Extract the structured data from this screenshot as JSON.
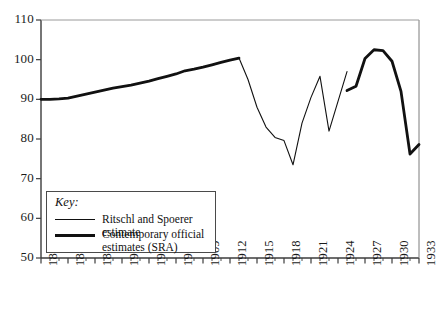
{
  "chart_data": {
    "type": "line",
    "title": "",
    "xlabel": "",
    "ylabel": "",
    "xlim": [
      1891,
      1933
    ],
    "ylim": [
      50,
      110
    ],
    "grid": false,
    "x_tick_labels": [
      "1891",
      "1894",
      "1897",
      "1900",
      "1903",
      "1906",
      "1909",
      "1912",
      "1915",
      "1918",
      "1921",
      "1924",
      "1927",
      "1930",
      "1933"
    ],
    "x_tick_values": [
      1891,
      1894,
      1897,
      1900,
      1903,
      1906,
      1909,
      1912,
      1915,
      1918,
      1921,
      1924,
      1927,
      1930,
      1933
    ],
    "x_minor_tick_values": [
      1892,
      1893,
      1895,
      1896,
      1898,
      1899,
      1901,
      1902,
      1904,
      1905,
      1907,
      1908,
      1910,
      1911,
      1913,
      1914,
      1916,
      1917,
      1919,
      1920,
      1922,
      1923,
      1925,
      1926,
      1928,
      1929,
      1931,
      1932
    ],
    "y_tick_labels": [
      "110",
      "100",
      "90",
      "80",
      "70",
      "60",
      "50"
    ],
    "y_tick_values": [
      110,
      100,
      90,
      80,
      70,
      60,
      50
    ],
    "legend_position": "lower-left",
    "series": [
      {
        "name": "Contemporary official estimates (SRA)",
        "style": "thick",
        "segments": [
          {
            "x": [
              1891,
              1892,
              1893,
              1894,
              1895,
              1896,
              1897,
              1898,
              1899,
              1900,
              1901,
              1902,
              1903,
              1904,
              1905,
              1906,
              1907,
              1908,
              1909,
              1910,
              1911,
              1912,
              1913
            ],
            "y": [
              90.0,
              90.0,
              90.1,
              90.3,
              90.8,
              91.3,
              91.8,
              92.3,
              92.8,
              93.2,
              93.6,
              94.1,
              94.6,
              95.2,
              95.8,
              96.4,
              97.2,
              97.6,
              98.1,
              98.7,
              99.3,
              99.9,
              100.4
            ]
          },
          {
            "x": [
              1925,
              1926,
              1927,
              1928,
              1929,
              1930,
              1931,
              1932,
              1933
            ],
            "y": [
              92.2,
              93.3,
              100.3,
              102.5,
              102.3,
              99.6,
              92.0,
              76.2,
              78.6
            ]
          }
        ]
      },
      {
        "name": "Ritschl and Spoerer estimate",
        "style": "thin",
        "segments": [
          {
            "x": [
              1913,
              1914,
              1915,
              1916,
              1917,
              1918,
              1919,
              1920,
              1921,
              1922,
              1923,
              1924,
              1925
            ],
            "y": [
              100.4,
              95.0,
              88.0,
              83.0,
              80.4,
              79.6,
              73.5,
              84.0,
              90.5,
              95.8,
              82.0,
              89.5,
              97.0
            ]
          }
        ]
      }
    ]
  },
  "legend": {
    "title": "Key:",
    "entries": [
      {
        "label": "Ritschl and Spoerer estimate",
        "style": "thin"
      },
      {
        "label": "Contemporary official estimates (SRA)",
        "style": "thick"
      }
    ]
  },
  "colors": {
    "axis": "#3c3c3c",
    "line": "#111111",
    "background": "#ffffff",
    "text": "#1a1a1a"
  }
}
